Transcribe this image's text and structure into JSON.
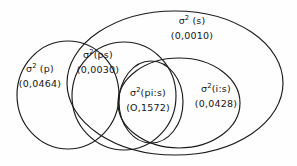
{
  "figure": {
    "type": "venn-diagram",
    "background_color": "#fefefe",
    "stroke_color": "#1a1a1a",
    "regions": [
      {
        "id": "s",
        "name": "σ² (s)",
        "symbol": "σ",
        "exponent": "2",
        "subject": " (s)",
        "value": "(0,0010)"
      },
      {
        "id": "ps",
        "name": "σ²(ps)",
        "symbol": "σ",
        "exponent": "2",
        "subject": "(ps)",
        "value": "(0,0030)"
      },
      {
        "id": "p",
        "name": "σ²(p)",
        "symbol": "σ",
        "exponent": "2",
        "subject": " (p)",
        "value": "(0,0464)"
      },
      {
        "id": "pis",
        "name": "σ²(pi:s)",
        "symbol": "σ",
        "exponent": "2",
        "subject": "(pi:s)",
        "value": "(O,1572)"
      },
      {
        "id": "is",
        "name": "σ²(i:s)",
        "symbol": "σ",
        "exponent": "2",
        "subject": "(i:s)",
        "value": "(0,0428)"
      }
    ]
  }
}
